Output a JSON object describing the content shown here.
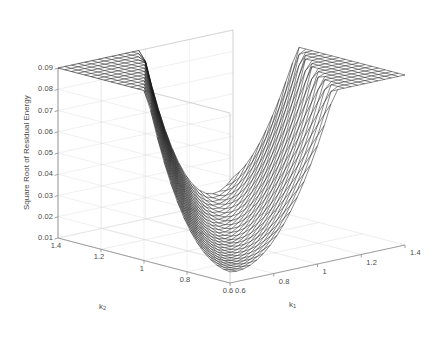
{
  "figure": {
    "background": "#ffffff",
    "mesh_color": "#1a1a1a",
    "axis_color": "#8c8c8c",
    "grid_color": "#d8d8d8",
    "text_color": "#4a4a4a"
  },
  "axes": {
    "z": {
      "label": "Square Root of Residual Energy",
      "ticks": [
        "0.09",
        "0.08",
        "0.07",
        "0.06",
        "0.05",
        "0.04",
        "0.03",
        "0.02",
        "0.01"
      ],
      "range": [
        0.01,
        0.09
      ]
    },
    "k2": {
      "label_base": "k",
      "label_sub": "2",
      "ticks": [
        "1.4",
        "1.2",
        "1",
        "0.8",
        "0.6"
      ],
      "range": [
        0.6,
        1.4
      ]
    },
    "k1": {
      "label_base": "k",
      "label_sub": "1",
      "ticks": [
        "0.6",
        "0.8",
        "1",
        "1.2",
        "1.4"
      ],
      "range": [
        0.6,
        1.4
      ]
    }
  },
  "chart_data": {
    "type": "surface",
    "title": "",
    "xlabel": "k_1",
    "ylabel": "k_2",
    "zlabel": "Square Root of Residual Energy",
    "xlim": [
      0.6,
      1.4
    ],
    "ylim": [
      0.6,
      1.4
    ],
    "zlim": [
      0.01,
      0.09
    ],
    "grid": true,
    "legend": "none",
    "mesh_n": 26,
    "view": {
      "azimuth": -37.5,
      "elevation": 30
    },
    "surface_model": {
      "form": "z = a + b*((k1 - c1*k2 - d1)^2) * (1 + e*sin(f*(k2 - g))) + h*(k2 - 1.0)^2",
      "a": 0.012,
      "b": 0.46,
      "c1": 0.85,
      "d1": 0.12,
      "e": 0.55,
      "f": 2.4,
      "g": 0.75,
      "h": 0.018
    },
    "sample_points": [
      {
        "k1": 0.6,
        "k2": 1.4,
        "z": 0.083
      },
      {
        "k1": 0.6,
        "k2": 1.0,
        "z": 0.036
      },
      {
        "k1": 0.6,
        "k2": 0.6,
        "z": 0.021
      },
      {
        "k1": 1.0,
        "k2": 1.4,
        "z": 0.03
      },
      {
        "k1": 1.0,
        "k2": 1.0,
        "z": 0.013
      },
      {
        "k1": 1.0,
        "k2": 0.6,
        "z": 0.052
      },
      {
        "k1": 1.4,
        "k2": 1.4,
        "z": 0.014
      },
      {
        "k1": 1.4,
        "k2": 1.0,
        "z": 0.047
      },
      {
        "k1": 1.4,
        "k2": 0.6,
        "z": 0.088
      }
    ]
  }
}
